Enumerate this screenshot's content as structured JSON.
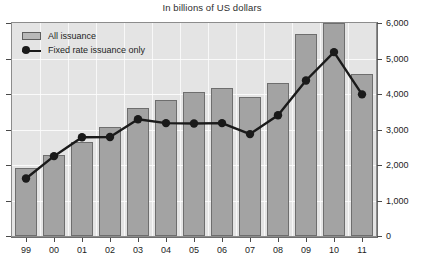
{
  "chart_data": {
    "type": "bar",
    "title": "In billions of US dollars",
    "xlabel": "",
    "ylabel": "",
    "ylim": [
      0,
      6000
    ],
    "yticks": [
      0,
      1000,
      2000,
      3000,
      4000,
      5000,
      6000
    ],
    "ytick_labels": [
      "0",
      "1,000",
      "2,000",
      "3,000",
      "4,000",
      "5,000",
      "6,000"
    ],
    "y_axis_position": "right",
    "grid": true,
    "legend_position": "top-left",
    "categories": [
      "99",
      "00",
      "01",
      "02",
      "03",
      "04",
      "05",
      "06",
      "07",
      "08",
      "09",
      "10",
      "11"
    ],
    "series": [
      {
        "name": "All issuance",
        "type": "bar",
        "color": "#a3a3a3",
        "values": [
          1930,
          2270,
          2660,
          3080,
          3620,
          3840,
          4060,
          4180,
          3930,
          4320,
          5700,
          6000,
          4550
        ]
      },
      {
        "name": "Fixed rate issuance only",
        "type": "line",
        "color": "#1a1a1a",
        "values": [
          1620,
          2250,
          2780,
          2790,
          3290,
          3180,
          3170,
          3180,
          2870,
          3400,
          4380,
          5180,
          3990
        ]
      }
    ]
  },
  "legend": {
    "items": [
      {
        "label": "All issuance",
        "marker": "bar-swatch"
      },
      {
        "label": "Fixed rate issuance only",
        "marker": "line-dot"
      }
    ]
  }
}
